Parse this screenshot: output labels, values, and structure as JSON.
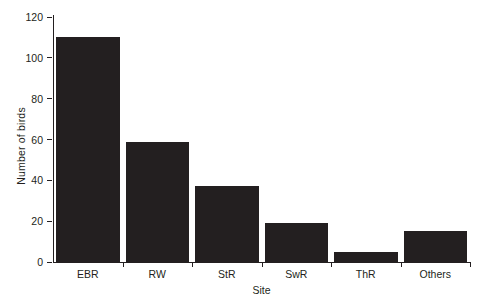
{
  "chart_data": {
    "type": "bar",
    "title": "",
    "categories": [
      "EBR",
      "RW",
      "StR",
      "SwR",
      "ThR",
      "Others"
    ],
    "values": [
      110,
      59,
      37,
      19,
      5,
      15
    ],
    "series": [
      {
        "name": "Number of birds",
        "values": [
          110,
          59,
          37,
          19,
          5,
          15
        ]
      }
    ],
    "xlabel": "Site",
    "ylabel": "Number of birds",
    "ylim": [
      0,
      120
    ],
    "yticks": [
      0,
      20,
      40,
      60,
      80,
      100,
      120
    ],
    "ytick_labels": [
      "0",
      "20",
      "40",
      "60",
      "80",
      "100",
      "120"
    ],
    "grid": false,
    "legend": false,
    "legend_position": "none",
    "bar_color": "#231f20",
    "axis_color": "#231f20",
    "background_color": "#ffffff"
  }
}
